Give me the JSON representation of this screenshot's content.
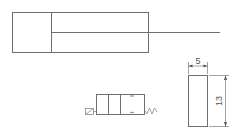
{
  "diagram": {
    "type": "pneumatic-schematic",
    "elements": [
      {
        "id": "cylinder",
        "label": "single-acting cylinder with piston rod"
      },
      {
        "id": "valve",
        "label": "3-position directional valve, solenoid-actuated, spring return"
      },
      {
        "id": "part",
        "label": "rectangular part with dimensions"
      }
    ],
    "dimensions": {
      "width_label": "5",
      "height_label": "13"
    },
    "colors": {
      "line": "#6f6f6f",
      "background": "#ffffff"
    }
  }
}
